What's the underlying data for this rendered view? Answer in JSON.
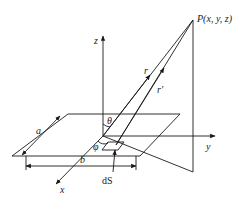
{
  "diagram": {
    "type": "geometry-3d",
    "labels": {
      "point": "P(x, y, z)",
      "z_axis": "z",
      "y_axis": "y",
      "x_axis": "x",
      "r": "r",
      "r_prime": "r'",
      "theta": "θ",
      "phi": "φ",
      "side_a": "a",
      "side_b": "b",
      "surface_element": "dS"
    },
    "colors": {
      "line": "#1a1a1a",
      "background": "#ffffff"
    }
  }
}
